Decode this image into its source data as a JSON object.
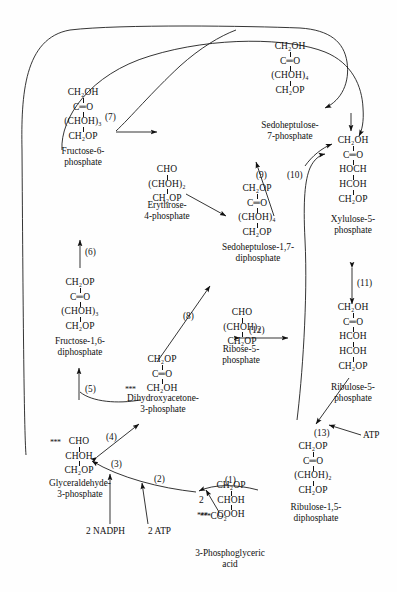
{
  "diagram": {
    "line_color": "#111111",
    "background": "#fefefe"
  },
  "molecules": {
    "fructose6p": {
      "l1": "CH₂OH",
      "l2": "C═O",
      "l3": "(CHOH)₃",
      "l4": "CH₂OP"
    },
    "erythrose4p": {
      "l1": "CHO",
      "l2": "(CHOH)₂",
      "l3": "CH₂OP"
    },
    "sedoheptulose7p": {
      "l1": "CH₂OH",
      "l2": "C═O",
      "l3": "(CHOH)₄",
      "l4": "CH₂OP"
    },
    "xylulose5p": {
      "l1": "CH₂OH",
      "l2": "C═O",
      "l3": "HOCH",
      "l4": "HCOH",
      "l5": "CH₂OP"
    },
    "sedoheptulose17dp": {
      "l1": "CH₂OP",
      "l2": "C═O",
      "l3": "(CHOH)₄",
      "l4": "CH₂OP"
    },
    "fructose16dp": {
      "l1": "CH₂OP",
      "l2": "C═O",
      "l3": "(CHOH)₃",
      "l4": "CH₂OP"
    },
    "ribose5p": {
      "l1": "CHO",
      "l2": "(CHOH)₃",
      "l3": "CH₂OP"
    },
    "ribulose5p": {
      "l1": "CH₂OH",
      "l2": "C═O",
      "l3": "HCOH",
      "l4": "HCOH",
      "l5": "CH₂OP"
    },
    "dhap": {
      "l1": "CH₂OP",
      "l2": "C═O",
      "l3": "CH₂OH",
      "star3": "***"
    },
    "gap": {
      "l1": "CHO",
      "star1": "***",
      "l2": "CHOH",
      "l3": "CH₂OP"
    },
    "pga": {
      "l1": "CH₂OP",
      "l2": "CHOH",
      "prefix2": "2",
      "l3": "COOH",
      "star3": "***"
    },
    "ribulose15dp": {
      "l1": "CH₂OP",
      "l2": "C═O",
      "l3": "(CHOH)₂",
      "l4": "CH₂OP"
    }
  },
  "names": {
    "fructose6p": {
      "line1": "Fructose-6-",
      "line2": "phosphate"
    },
    "erythrose4p": {
      "line1": "Erythrose-",
      "line2": "4-phosphate"
    },
    "sedoheptulose7p": {
      "line1": "Sedoheptulose-",
      "line2": "7-phosphate"
    },
    "xylulose5p": {
      "line1": "Xylulose-5-",
      "line2": "phosphate"
    },
    "sedoheptulose17dp": {
      "line1": "Sedoheptulose-1,7-",
      "line2": "diphosphate"
    },
    "fructose16dp": {
      "line1": "Fructose-1,6-",
      "line2": "diphosphate"
    },
    "ribose5p": {
      "line1": "Ribose-5-",
      "line2": "phosphate"
    },
    "ribulose5p": {
      "line1": "Ribulose-5-",
      "line2": "phosphate"
    },
    "dhap": {
      "line1": "Dihydroxyacetone-",
      "line2": "3-phosphate"
    },
    "gap": {
      "line1": "Glyceraldehyde-",
      "line2": "3-phosphate"
    },
    "pga": {
      "line1": "3-Phosphoglyceric",
      "line2": "acid"
    },
    "ribulose15dp": {
      "line1": "Ribulose-1,5-",
      "line2": "diphosphate"
    }
  },
  "steps": {
    "s1": "(1)",
    "s2": "(2)",
    "s3": "(3)",
    "s4": "(4)",
    "s5": "(5)",
    "s6": "(6)",
    "s7": "(7)",
    "s8": "(8)",
    "s9": "(9)",
    "s10": "(10)",
    "s11": "(11)",
    "s12": "(12)",
    "s13": "(13)"
  },
  "cofactors": {
    "nadph": "2 NADPH",
    "atp_lower": "2 ATP",
    "atp_right": "ATP",
    "co2_label": "CO₂",
    "co2_star": "***"
  }
}
